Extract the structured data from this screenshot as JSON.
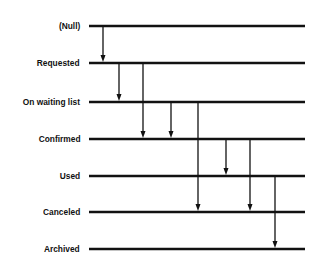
{
  "diagram": {
    "type": "state-transition",
    "line_color": "#111111",
    "background": "#ffffff",
    "states": [
      {
        "label": "(Null)",
        "y": 26
      },
      {
        "label": "Requested",
        "y": 63
      },
      {
        "label": "On waiting list",
        "y": 102
      },
      {
        "label": "Confirmed",
        "y": 139
      },
      {
        "label": "Used",
        "y": 176
      },
      {
        "label": "Canceled",
        "y": 212
      },
      {
        "label": "Archived",
        "y": 249
      }
    ],
    "line_x_start": 89,
    "line_x_end": 305,
    "transitions": [
      {
        "from": "(Null)",
        "to": "Requested",
        "x": 103
      },
      {
        "from": "Requested",
        "to": "On waiting list",
        "x": 119
      },
      {
        "from": "Requested",
        "to": "Confirmed",
        "x": 143
      },
      {
        "from": "On waiting list",
        "to": "Confirmed",
        "x": 171
      },
      {
        "from": "On waiting list",
        "to": "Canceled",
        "x": 198
      },
      {
        "from": "Confirmed",
        "to": "Used",
        "x": 226
      },
      {
        "from": "Confirmed",
        "to": "Canceled",
        "x": 250
      },
      {
        "from": "Used",
        "to": "Archived",
        "x": 275
      }
    ]
  }
}
